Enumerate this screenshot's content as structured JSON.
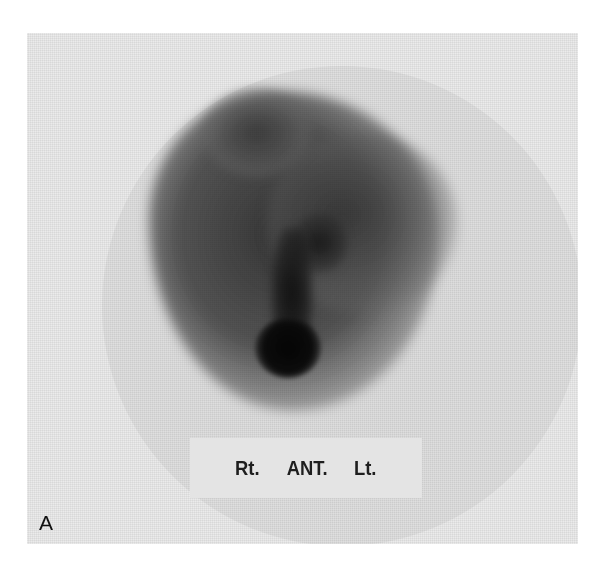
{
  "figure": {
    "panel_label": "A",
    "orientation_labels": {
      "right": "Rt.",
      "view": "ANT.",
      "left": "Lt."
    }
  }
}
